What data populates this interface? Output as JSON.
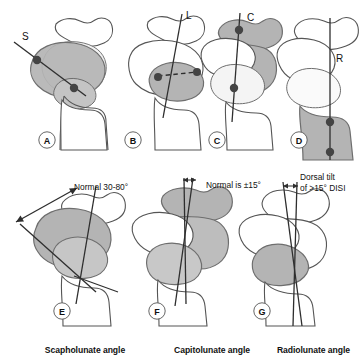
{
  "figure": {
    "background_color": "#ffffff",
    "ink_color": "#3a3a3a",
    "bone_outline_color": "#555555",
    "shade_fill": "#b4b4b4",
    "shade_fill_light": "#d8d8d8",
    "shade_stroke": "#6e6e6e",
    "axis_line_color": "#2e2e2e",
    "marker_color": "#444444",
    "label_color": "#111111"
  },
  "panels": [
    {
      "id": "A",
      "letter": "A",
      "axis_label": "S",
      "axis_name": "scaphoid-axis",
      "highlight": "scaphoid",
      "annotation": "",
      "markers": 2
    },
    {
      "id": "B",
      "letter": "B",
      "axis_label": "L",
      "axis_name": "lunate-axis",
      "highlight": "lunate",
      "annotation": "",
      "markers": 2
    },
    {
      "id": "C",
      "letter": "C",
      "axis_label": "C",
      "axis_name": "capitate-axis",
      "highlight": "capitate",
      "annotation": "",
      "markers": 2
    },
    {
      "id": "D",
      "letter": "D",
      "axis_label": "R",
      "axis_name": "radius-axis",
      "highlight": "radius",
      "annotation": "",
      "markers": 2
    },
    {
      "id": "E",
      "letter": "E",
      "axis_label": "",
      "axis_name": "scapholunate-angle",
      "highlight": "scaphoid-and-lunate",
      "annotation": "Normal 30-80°",
      "markers": 0
    },
    {
      "id": "F",
      "letter": "F",
      "axis_label": "",
      "axis_name": "capitolunate-angle",
      "highlight": "capitate-and-lunate",
      "annotation": "Normal is ±15°",
      "markers": 0
    },
    {
      "id": "G",
      "letter": "G",
      "axis_label": "",
      "axis_name": "radiolunate-angle",
      "highlight": "lunate-tilted",
      "annotation_line1": "Dorsal tilt",
      "annotation_line2": "of >15° DISI",
      "markers": 0
    }
  ],
  "captions": {
    "scapholunate": "Scapholunate angle",
    "capitolunate": "Capitolunate angle",
    "radiolunate": "Radiolunate angle"
  }
}
